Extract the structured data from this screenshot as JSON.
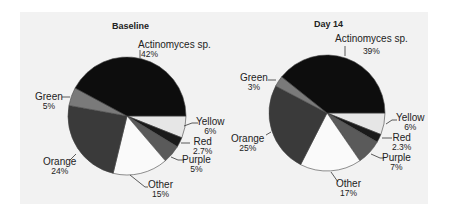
{
  "chart_data": [
    {
      "type": "pie",
      "title": "Baseline",
      "categories": [
        "Actinomyces sp.",
        "Yellow",
        "Red",
        "Purple",
        "Other",
        "Orange",
        "Green"
      ],
      "values": [
        42,
        6,
        2.7,
        5,
        15,
        24,
        5
      ],
      "labels": [
        "42%",
        "6%",
        "2.7%",
        "5%",
        "15%",
        "24%",
        "5%"
      ],
      "colors": [
        "#0d0d0d",
        "#e6e6e6",
        "#1a1a1a",
        "#5a5a5a",
        "#fafafa",
        "#3a3a3a",
        "#7a7a7a"
      ],
      "legend": "none (data labels)"
    },
    {
      "type": "pie",
      "title": "Day 14",
      "categories": [
        "Actinomyces sp.",
        "Yellow",
        "Red",
        "Purple",
        "Other",
        "Orange",
        "Green"
      ],
      "values": [
        39,
        6,
        2.3,
        7,
        17,
        25,
        3
      ],
      "labels": [
        "39%",
        "6%",
        "2.3%",
        "7%",
        "17%",
        "25%",
        "3%"
      ],
      "colors": [
        "#0d0d0d",
        "#e6e6e6",
        "#1a1a1a",
        "#5a5a5a",
        "#fafafa",
        "#3a3a3a",
        "#7a7a7a"
      ],
      "legend": "none (data labels)"
    }
  ],
  "baseline": {
    "title": "Baseline",
    "actinomyces": {
      "name": "Actinomyces sp.",
      "pct": "42%"
    },
    "yellow": {
      "name": "Yellow",
      "pct": "6%"
    },
    "red": {
      "name": "Red",
      "pct": "2.7%"
    },
    "purple": {
      "name": "Purple",
      "pct": "5%"
    },
    "other": {
      "name": "Other",
      "pct": "15%"
    },
    "orange": {
      "name": "Orange",
      "pct": "24%"
    },
    "green": {
      "name": "Green",
      "pct": "5%"
    }
  },
  "day14": {
    "title": "Day 14",
    "actinomyces": {
      "name": "Actinomyces sp.",
      "pct": "39%"
    },
    "yellow": {
      "name": "Yellow",
      "pct": "6%"
    },
    "red": {
      "name": "Red",
      "pct": "2.3%"
    },
    "purple": {
      "name": "Purple",
      "pct": "7%"
    },
    "other": {
      "name": "Other",
      "pct": "17%"
    },
    "orange": {
      "name": "Orange",
      "pct": "25%"
    },
    "green": {
      "name": "Green",
      "pct": "3%"
    }
  }
}
